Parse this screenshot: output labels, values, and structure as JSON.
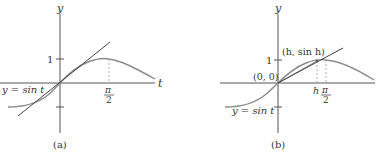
{
  "figure": {
    "panels": [
      {
        "id": "a",
        "caption": "(a)",
        "axis_x_label": "t",
        "axis_y_label": "y",
        "tick_y_pos": "1",
        "tick_x": {
          "num": "π",
          "den": "2"
        },
        "curve_label": "y = sin t",
        "elements": [
          "sine curve",
          "tangent line at origin (y = t)",
          "dashed line at t = π/2"
        ]
      },
      {
        "id": "b",
        "caption": "(b)",
        "axis_y_label": "y",
        "tick_y_pos": "1",
        "origin_label": "(0, 0)",
        "point_label": "(h, sin h)",
        "tick_h": "h",
        "tick_x": {
          "num": "π",
          "den": "2"
        },
        "curve_label": "y = sin t",
        "elements": [
          "sine curve",
          "secant line from (0,0) to (h, sin h)",
          "tangent line at origin",
          "dashed lines at t = h and t = π/2"
        ]
      }
    ],
    "colors": {
      "axis": "#555555",
      "curve": "#8a8a8a",
      "tangent": "#444444",
      "dashed": "#999999",
      "text": "#333333"
    }
  }
}
